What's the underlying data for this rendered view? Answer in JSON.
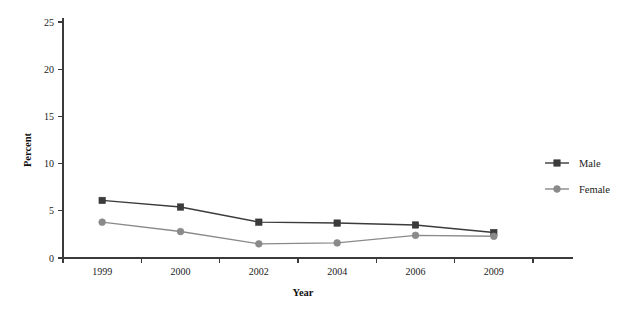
{
  "chart_data": {
    "type": "line",
    "title": "",
    "xlabel": "Year",
    "ylabel": "Percent",
    "categories": [
      "1999",
      "2000",
      "2002",
      "2004",
      "2006",
      "2009"
    ],
    "series": [
      {
        "name": "Male",
        "values": [
          6.1,
          5.4,
          3.8,
          3.7,
          3.5,
          2.7
        ],
        "color": "#3b3b3b",
        "marker": "square"
      },
      {
        "name": "Female",
        "values": [
          3.8,
          2.8,
          1.5,
          1.6,
          2.4,
          2.3
        ],
        "color": "#8a8a8a",
        "marker": "circle"
      }
    ],
    "ylim": [
      0,
      25
    ],
    "yticks": [
      0,
      5,
      10,
      15,
      20,
      25
    ],
    "ytick_labels": [
      "0",
      "5",
      "10",
      "15",
      "20",
      "25"
    ],
    "grid": false,
    "legend_position": "right"
  },
  "legend": {
    "entries": [
      {
        "label": "Male"
      },
      {
        "label": "Female"
      }
    ]
  },
  "axes": {
    "y_title": "Percent",
    "x_title": "Year"
  }
}
